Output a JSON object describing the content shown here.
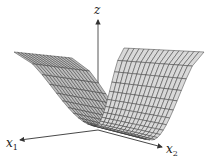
{
  "figure": {
    "type": "3d-surface",
    "axes": {
      "z": {
        "label": "z"
      },
      "x1": {
        "label": "x",
        "subscript": "1"
      },
      "x2": {
        "label": "x",
        "subscript": "2"
      }
    },
    "colors": {
      "surface_fill": "#d9d9d9",
      "surface_fill_dark": "#bdbdbd",
      "mesh_line": "#3a3a3a",
      "axis": "#333333"
    }
  }
}
